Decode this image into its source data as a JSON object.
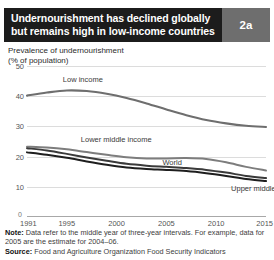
{
  "header": {
    "title_line1": "Undernourishment has declined globally",
    "title_line2": "but remains high in low-income countries",
    "badge": "2a",
    "bar_color": "#1c1c1c",
    "badge_color": "#6e6e6e"
  },
  "subtitle": {
    "line1": "Prevalence of undernourishment",
    "line2": "(% of population)"
  },
  "footer": {
    "note_label": "Note:",
    "note_text": " Data refer to the middle year of three-year intervals. For example, data for 2005 are the estimate for 2004–06.",
    "source_label": "Source:",
    "source_text": " Food and Agriculture Organization Food Security Indicators"
  },
  "chart_data": {
    "type": "line",
    "title": "Undernourishment has declined globally but remains high in low-income countries",
    "subtitle": "Prevalence of undernourishment (% of population)",
    "xlabel": "",
    "ylabel": "% of population",
    "xlim": [
      1991,
      2015
    ],
    "ylim": [
      0,
      50
    ],
    "yticks": [
      10,
      20,
      30,
      40,
      50
    ],
    "xticks": [
      1991,
      1995,
      2000,
      2005,
      2010,
      2015
    ],
    "zero_tick": "0",
    "grid": true,
    "legend": "inline-labels",
    "x": [
      1991,
      1993,
      1995,
      1997,
      1999,
      2001,
      2003,
      2005,
      2007,
      2009,
      2011,
      2013,
      2015
    ],
    "series": [
      {
        "name": "Low income",
        "color": "#6e6e6e",
        "width": 2.1,
        "label_x": 1994.6,
        "label_y": 45.4,
        "values": [
          40.2,
          41.2,
          41.9,
          41.7,
          40.8,
          39.4,
          37.6,
          35.6,
          33.7,
          32.1,
          31.0,
          30.2,
          29.8
        ]
      },
      {
        "name": "Lower middle income",
        "color": "#7d7d7d",
        "width": 2.0,
        "label_x": 1996.4,
        "label_y": 25.5,
        "values": [
          23.3,
          23.0,
          22.4,
          21.5,
          20.6,
          19.8,
          19.4,
          19.4,
          19.5,
          19.2,
          18.1,
          16.6,
          15.4
        ]
      },
      {
        "name": "World",
        "color": "#3a3a3a",
        "width": 2.0,
        "label_x": 2004.6,
        "label_y": 17.9,
        "values": [
          22.8,
          22.0,
          20.9,
          19.7,
          18.6,
          17.6,
          17.0,
          16.6,
          16.2,
          15.6,
          14.7,
          13.6,
          12.9
        ]
      },
      {
        "name": "Upper middle income",
        "color": "#1e1e1e",
        "width": 2.0,
        "label_x": 2011.5,
        "label_y": 9.3,
        "values": [
          21.4,
          20.6,
          19.6,
          18.4,
          17.3,
          16.4,
          15.9,
          15.6,
          15.2,
          14.5,
          13.6,
          12.6,
          11.9
        ]
      }
    ]
  }
}
